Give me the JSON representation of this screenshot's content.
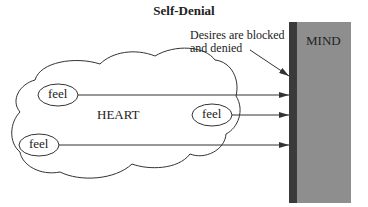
{
  "title": "Self-Denial",
  "annotation": {
    "line1": "Desires are blocked",
    "line2": "and denied"
  },
  "heart": {
    "label": "HEART"
  },
  "mind": {
    "label": "MIND"
  },
  "feelings": [
    {
      "label": "feel"
    },
    {
      "label": "feel"
    },
    {
      "label": "feel"
    }
  ],
  "colors": {
    "wall": "#3a3a3a",
    "mind": "#8e8e8e",
    "stroke": "#333333"
  }
}
